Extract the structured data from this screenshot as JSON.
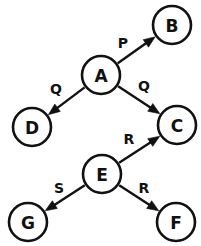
{
  "diagram": {
    "type": "directed-graph",
    "colors": {
      "background": "#ffffff",
      "stroke": "#111111",
      "node_fill": "#ffffff",
      "text": "#111111"
    },
    "nodes": [
      {
        "id": "A",
        "label": "A",
        "cx": 101,
        "cy": 75,
        "r": 19
      },
      {
        "id": "B",
        "label": "B",
        "cx": 172,
        "cy": 25,
        "r": 19
      },
      {
        "id": "C",
        "label": "C",
        "cx": 177,
        "cy": 125,
        "r": 19
      },
      {
        "id": "D",
        "label": "D",
        "cx": 32,
        "cy": 127,
        "r": 19
      },
      {
        "id": "E",
        "label": "E",
        "cx": 102,
        "cy": 174,
        "r": 19
      },
      {
        "id": "F",
        "label": "F",
        "cx": 176,
        "cy": 222,
        "r": 19
      },
      {
        "id": "G",
        "label": "G",
        "cx": 28,
        "cy": 222,
        "r": 19
      }
    ],
    "edges": [
      {
        "from": "A",
        "to": "B",
        "label": "P",
        "label_x": 123,
        "label_y": 43
      },
      {
        "from": "A",
        "to": "D",
        "label": "Q",
        "label_x": 56,
        "label_y": 89
      },
      {
        "from": "A",
        "to": "C",
        "label": "Q",
        "label_x": 144,
        "label_y": 86
      },
      {
        "from": "E",
        "to": "C",
        "label": "R",
        "label_x": 129,
        "label_y": 139
      },
      {
        "from": "E",
        "to": "G",
        "label": "S",
        "label_x": 59,
        "label_y": 188
      },
      {
        "from": "E",
        "to": "F",
        "label": "R",
        "label_x": 144,
        "label_y": 188
      }
    ]
  }
}
